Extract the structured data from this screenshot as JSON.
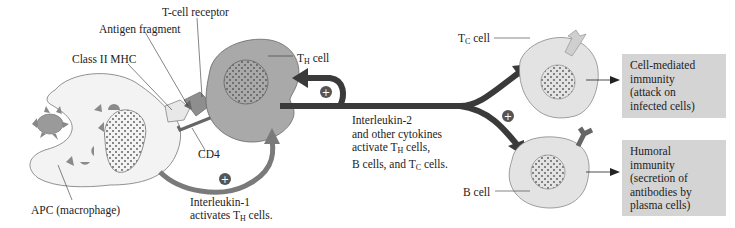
{
  "labels": {
    "t_cell_receptor": "T-cell receptor",
    "antigen_fragment": "Antigen fragment",
    "class_ii_mhc": "Class II MHC",
    "cd4": "CD4",
    "apc": "APC (macrophage)",
    "th_cell": {
      "main": "T",
      "sub": "H",
      "suffix": " cell"
    },
    "tc_cell": {
      "main": "T",
      "sub": "C",
      "suffix": " cell"
    },
    "b_cell": "B cell",
    "interleukin1": {
      "line1": "Interleukin-1",
      "line2_pre": "activates T",
      "line2_sub": "H",
      "line2_post": " cells."
    },
    "interleukin2": {
      "line1": "Interleukin-2",
      "line2": "and other cytokines",
      "line3_pre": "activate T",
      "line3_sub": "H",
      "line3_post": " cells,",
      "line4_pre": "B cells, and T",
      "line4_sub": "C",
      "line4_post": " cells."
    }
  },
  "outcomes": {
    "cell_mediated": [
      "Cell-mediated",
      "immunity",
      "(attack on",
      "infected cells)"
    ],
    "humoral": [
      "Humoral",
      "immunity",
      "(secretion of",
      "antibodies by",
      "plasma cells)"
    ]
  },
  "symbols": {
    "plus": "+"
  },
  "colors": {
    "apc_fill": "#f3f3f3",
    "th_fill": "#a9a9a9",
    "tc_fill": "#e3e3e3",
    "arrow": "#3a3a3a",
    "il1_arrow": "#7a7a7a",
    "box_fill": "#d4d4d4"
  }
}
